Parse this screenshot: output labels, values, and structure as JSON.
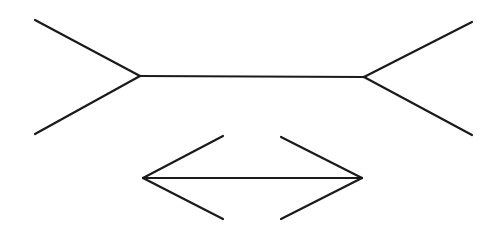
{
  "title": "",
  "illusion": "Müller-Lyer",
  "figures": [
    {
      "name": "outward-fins",
      "shaft": [
        [
          140,
          76
        ],
        [
          364,
          77
        ]
      ],
      "fins": [
        [
          [
            140,
            76
          ],
          [
            35,
            20
          ]
        ],
        [
          [
            140,
            76
          ],
          [
            35,
            134
          ]
        ],
        [
          [
            364,
            77
          ],
          [
            472,
            22
          ]
        ],
        [
          [
            364,
            77
          ],
          [
            472,
            135
          ]
        ]
      ]
    },
    {
      "name": "inward-arrows",
      "shaft": [
        [
          143,
          178
        ],
        [
          362,
          178
        ]
      ],
      "fins": [
        [
          [
            143,
            178
          ],
          [
            223,
            136
          ]
        ],
        [
          [
            143,
            178
          ],
          [
            223,
            219
          ]
        ],
        [
          [
            362,
            178
          ],
          [
            281,
            137
          ]
        ],
        [
          [
            362,
            178
          ],
          [
            281,
            219
          ]
        ]
      ]
    }
  ],
  "colors": {
    "line": "#1a1a1a",
    "background": "#ffffff"
  }
}
